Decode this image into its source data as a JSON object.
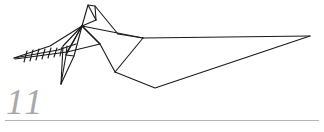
{
  "page": {
    "width": 324,
    "height": 132,
    "background_color": "#ffffff",
    "page_number": "11",
    "page_number_color": "#a8a8a8",
    "footer_rule_color": "#b3b3b3"
  },
  "figure": {
    "name": "origami-crane-line-drawing",
    "caption": "",
    "stroke_color": "#1a1a1a",
    "stroke_width": 1.1,
    "fill": "none",
    "polylines": [
      {
        "name": "beak-spike-upper",
        "points": "14,58 50,46 82,26"
      },
      {
        "name": "beak-spike-lower",
        "points": "14,58 58,50 76,44"
      },
      {
        "name": "beak-shaft",
        "points": "15,59 67,52"
      },
      {
        "name": "head-crest-left",
        "points": "82,26 88,5 96,20"
      },
      {
        "name": "head-crest-right",
        "points": "88,5 95,6 118,34"
      },
      {
        "name": "head-crest-inner",
        "points": "95,6 96,20"
      },
      {
        "name": "neck-to-body-upper",
        "points": "82,26 143,38"
      },
      {
        "name": "crest-to-body",
        "points": "118,34 143,38"
      },
      {
        "name": "apex-fold-a",
        "points": "82,26 96,20"
      },
      {
        "name": "wing-fold-inner",
        "points": "82,26 100,44 115,72"
      },
      {
        "name": "body-lower-left",
        "points": "115,72 143,38"
      },
      {
        "name": "wing-crease",
        "points": "82,26 100,44"
      },
      {
        "name": "chest-fold",
        "points": "67,52 100,44"
      },
      {
        "name": "throat-fold",
        "points": "82,26 67,52"
      },
      {
        "name": "leg-outer",
        "points": "82,26 66,55 61,84"
      },
      {
        "name": "leg-inner",
        "points": "82,26 74,56 61,84"
      },
      {
        "name": "leg-strut",
        "points": "82,26 63,46 61,84"
      },
      {
        "name": "foot-fold",
        "points": "66,55 74,56"
      },
      {
        "name": "tail-top",
        "points": "143,38 310,36"
      },
      {
        "name": "tail-bottom",
        "points": "115,72 155,88 310,36"
      }
    ],
    "barbs": {
      "name": "beak-barb-ticks",
      "count": 8,
      "segments": [
        "24,62 27,51",
        "30,61 33,50",
        "36,60 39,49",
        "42,59 45,49",
        "48,58 51,48",
        "54,57 57,48",
        "60,56 62,47",
        "66,55 67,46"
      ]
    }
  }
}
